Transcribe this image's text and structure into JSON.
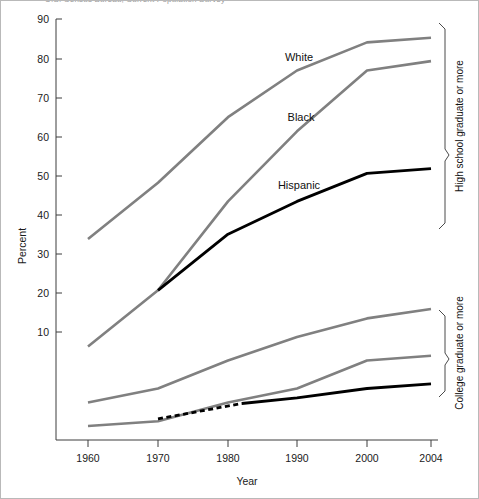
{
  "caption": {
    "text": "U.S. Census Bureau, Current Population Survey"
  },
  "chart_data": {
    "type": "line",
    "title": "",
    "xlabel": "Year",
    "ylabel": "Percent",
    "x": [
      1960,
      1970,
      1980,
      1990,
      2000,
      2004
    ],
    "xticklabels": [
      "1960",
      "1970",
      "1980",
      "1990",
      "2000",
      "2004"
    ],
    "yticks": [
      10,
      20,
      30,
      40,
      50,
      60,
      70,
      80,
      90
    ],
    "yticklabels": [
      "10",
      "20",
      "30",
      "40",
      "50",
      "60",
      "70",
      "80",
      "90"
    ],
    "ylim": [
      0,
      90
    ],
    "xlim": [
      1960,
      2004
    ],
    "grid": false,
    "legend_position": "inline-annotations",
    "groups": [
      {
        "name": "High school graduate or more",
        "bracket_label": "High school graduate or more",
        "series": [
          {
            "name": "White",
            "color": "#808080",
            "style": "solid",
            "values": [
              43,
              55,
              69,
              79,
              85,
              86
            ]
          },
          {
            "name": "Black",
            "color": "#808080",
            "style": "solid",
            "values": [
              20,
              32,
              51,
              66,
              79,
              81
            ]
          },
          {
            "name": "Hispanic",
            "color": "#000000",
            "style": "solid",
            "values": [
              null,
              32,
              44,
              51,
              57,
              58
            ]
          }
        ]
      },
      {
        "name": "College graduate or more",
        "bracket_label": "College graduate or more",
        "series": [
          {
            "name": "White",
            "color": "#808080",
            "style": "solid",
            "values": [
              8,
              11,
              17,
              22,
              26,
              28
            ]
          },
          {
            "name": "Black",
            "color": "#808080",
            "style": "solid",
            "values": [
              3,
              4,
              8,
              11,
              17,
              18
            ]
          },
          {
            "name": "Hispanic",
            "color": "#000000",
            "style": "solid-with-dashed-segment",
            "dashed_from": 1970,
            "dashed_to": 1982,
            "values": [
              null,
              4.5,
              7.5,
              9,
              11,
              12
            ]
          }
        ]
      }
    ],
    "annotations": [
      {
        "label": "White",
        "x": 1988,
        "y": 80
      },
      {
        "label": "Black",
        "x": 1989,
        "y": 65
      },
      {
        "label": "Hispanic",
        "x": 1988,
        "y": 52
      }
    ]
  }
}
